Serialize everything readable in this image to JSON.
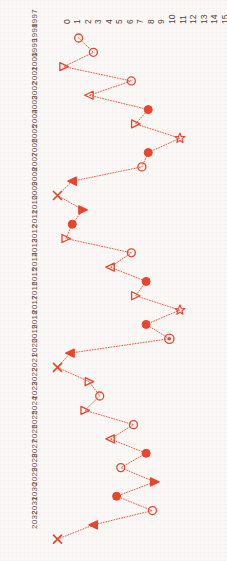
{
  "chart_data": {
    "type": "line",
    "title": "",
    "subtitle": "",
    "xlabel": "",
    "ylabel": "",
    "orientation": "rotated",
    "grid": false,
    "legend": null,
    "accent_color": "#e8452c",
    "background_color": "#fbf9f7",
    "xlim": [
      0,
      15
    ],
    "x_ticks": [
      "0",
      "1",
      "2",
      "3",
      "4",
      "5",
      "6",
      "7",
      "8",
      "9",
      "10",
      "11",
      "12",
      "13",
      "14",
      "15"
    ],
    "categories": [
      "1997",
      "1998",
      "1999",
      "2000",
      "2001",
      "2002",
      "2003",
      "2004",
      "2005",
      "2006",
      "2007",
      "2008",
      "2009",
      "2010",
      "2011",
      "2012",
      "2013",
      "2014",
      "2015",
      "2016",
      "2017",
      "2018",
      "2019",
      "2020",
      "2021",
      "2022",
      "2023",
      "2024",
      "2025",
      "2026",
      "2027",
      "2028",
      "2029",
      "2030",
      "2031",
      "2032"
    ],
    "values": [
      2.0,
      3.4,
      0.6,
      7.0,
      3.0,
      8.6,
      7.4,
      11.6,
      8.6,
      8.0,
      1.4,
      0.0,
      2.4,
      1.4,
      0.8,
      7.0,
      5.0,
      8.4,
      7.4,
      11.6,
      8.4,
      10.6,
      1.2,
      0.0,
      3.0,
      4.0,
      2.6,
      7.2,
      5.0,
      8.4,
      6.0,
      9.2,
      5.6,
      9.0,
      3.4,
      0.0
    ],
    "markers": [
      "circle-open",
      "circle-open",
      "triangle-right-open",
      "circle-open",
      "triangle-left-open",
      "circle-filled",
      "triangle-right-open",
      "star-open",
      "circle-filled",
      "circle-open",
      "triangle-left-filled",
      "x-mark",
      "triangle-right-filled",
      "circle-filled",
      "triangle-right-open",
      "circle-open",
      "triangle-left-open",
      "circle-filled",
      "triangle-right-open",
      "star-open",
      "circle-filled",
      "circle-dot",
      "triangle-left-filled",
      "x-mark",
      "triangle-right-open",
      "circle-open",
      "triangle-right-open",
      "circle-open",
      "triangle-left-open",
      "circle-filled",
      "circle-open",
      "triangle-right-filled",
      "circle-filled",
      "circle-open",
      "triangle-left-filled",
      "x-mark"
    ],
    "line_style": "dotted",
    "annotations": []
  }
}
